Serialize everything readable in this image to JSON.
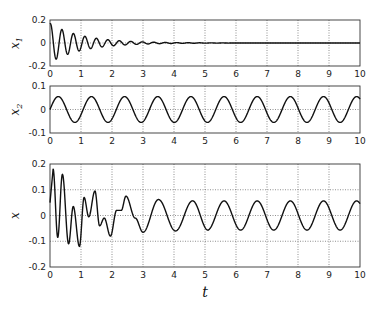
{
  "chart_data": [
    {
      "type": "line",
      "title": "",
      "ylabel": "x",
      "ylabel_sub": "1",
      "xlabel": "",
      "xlim": [
        0,
        10
      ],
      "ylim": [
        -0.2,
        0.2
      ],
      "xticks": [
        0,
        1,
        2,
        3,
        4,
        5,
        6,
        7,
        8,
        9,
        10
      ],
      "yticks": [
        -0.2,
        0,
        0.2
      ],
      "ytick_labels": [
        "-0.2",
        "0",
        "0.2"
      ],
      "grid": true,
      "description": "Damped oscillation decaying to zero by t≈4.5",
      "series": [
        {
          "name": "x1",
          "model": "damped",
          "amplitude": 0.17,
          "decay": 0.95,
          "frequency_hz": 2.7,
          "phase": 1.3
        }
      ]
    },
    {
      "type": "line",
      "title": "",
      "ylabel": "x",
      "ylabel_sub": "2",
      "xlabel": "",
      "xlim": [
        0,
        10
      ],
      "ylim": [
        -0.1,
        0.1
      ],
      "xticks": [
        0,
        1,
        2,
        3,
        4,
        5,
        6,
        7,
        8,
        9,
        10
      ],
      "yticks": [
        -0.1,
        0,
        0.1
      ],
      "ytick_labels": [
        "-0.1",
        "0",
        "0.1"
      ],
      "grid": true,
      "description": "Steady sinusoid, amplitude ≈0.055, period ≈1.07",
      "series": [
        {
          "name": "x2",
          "model": "sine",
          "amplitude": 0.055,
          "frequency_hz": 0.935,
          "phase": 0
        }
      ]
    },
    {
      "type": "line",
      "title": "",
      "ylabel": "x",
      "ylabel_sub": "",
      "xlabel": "t",
      "xlim": [
        0,
        10
      ],
      "ylim": [
        -0.2,
        0.2
      ],
      "xticks": [
        0,
        1,
        2,
        3,
        4,
        5,
        6,
        7,
        8,
        9,
        10
      ],
      "yticks": [
        -0.2,
        -0.1,
        0,
        0.1,
        0.2
      ],
      "ytick_labels": [
        "-0.2",
        "-0.1",
        "0",
        "0.1",
        "0.2"
      ],
      "grid": true,
      "description": "Sum of x1 and x2: large transient (peak ≈0.18 at t≈0.1) settling to sinusoid of amplitude ≈0.055",
      "series": [
        {
          "name": "x",
          "model": "sum",
          "components": [
            "x1",
            "x2"
          ]
        }
      ],
      "key_points": [
        {
          "t": 0.1,
          "x": 0.18
        },
        {
          "t": 0.25,
          "x": -0.085
        },
        {
          "t": 0.4,
          "x": 0.16
        },
        {
          "t": 0.6,
          "x": -0.11
        },
        {
          "t": 0.75,
          "x": 0.035
        },
        {
          "t": 0.95,
          "x": -0.12
        },
        {
          "t": 1.1,
          "x": 0.07
        },
        {
          "t": 1.25,
          "x": -0.005
        },
        {
          "t": 1.45,
          "x": 0.095
        },
        {
          "t": 1.6,
          "x": -0.04
        },
        {
          "t": 1.75,
          "x": -0.01
        },
        {
          "t": 1.95,
          "x": -0.08
        },
        {
          "t": 2.15,
          "x": 0.02
        },
        {
          "t": 2.3,
          "x": 0.02
        },
        {
          "t": 2.45,
          "x": 0.075
        },
        {
          "t": 2.75,
          "x": -0.01
        },
        {
          "t": 3.0,
          "x": -0.065
        },
        {
          "t": 3.5,
          "x": 0.062
        },
        {
          "t": 4.05,
          "x": -0.06
        },
        {
          "t": 4.6,
          "x": 0.057
        },
        {
          "t": 5.1,
          "x": -0.057
        }
      ]
    }
  ],
  "layout": {
    "plot_left": 50,
    "plot_right": 360,
    "panels": [
      {
        "top": 20,
        "bottom": 66
      },
      {
        "top": 86,
        "bottom": 133
      },
      {
        "top": 164,
        "bottom": 267
      }
    ],
    "xlabel_pos": [
      205,
      297
    ]
  }
}
